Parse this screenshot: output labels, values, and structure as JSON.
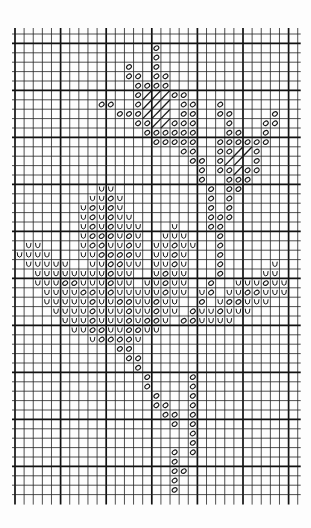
{
  "chart_title": "Cross-stitch pattern chart: flowers and leaves",
  "grid": {
    "cols": 31,
    "rows": 49,
    "origin_x": 15,
    "origin_y": 34,
    "cell_w": 9.12,
    "cell_h": 9.4,
    "heavy_col_every": 5,
    "heavy_col_offset": 0,
    "heavy_row_every": 5,
    "heavy_row_offset": 1,
    "line_color": "#222222",
    "heavy_line_color": "#111111",
    "symbol_color": "#1a1a1a"
  },
  "legend": {
    "o": "oval stitch symbol",
    "u": "u-shaped stitch symbol",
    "h": "hatched (diagonal) fill"
  },
  "cells": [
    {
      "r": 1,
      "c": [
        15
      ],
      "s": "o"
    },
    {
      "r": 2,
      "c": [
        15
      ],
      "s": "o"
    },
    {
      "r": 3,
      "c": [
        12,
        15
      ],
      "s": "o"
    },
    {
      "r": 4,
      "c": [
        12,
        13,
        15,
        16
      ],
      "s": "o"
    },
    {
      "r": 5,
      "c": [
        13,
        14,
        15,
        16
      ],
      "s": "o"
    },
    {
      "r": 6,
      "c": [
        13,
        17,
        18
      ],
      "s": "o"
    },
    {
      "r": 6,
      "c": [
        14,
        15,
        16
      ],
      "s": "h"
    },
    {
      "r": 7,
      "c": [
        9,
        10,
        13,
        18,
        19,
        22
      ],
      "s": "o"
    },
    {
      "r": 7,
      "c": [
        14,
        15,
        16
      ],
      "s": "h"
    },
    {
      "r": 8,
      "c": [
        11,
        12,
        13,
        18,
        19,
        22,
        23,
        28
      ],
      "s": "o"
    },
    {
      "r": 8,
      "c": [
        14,
        15,
        16
      ],
      "s": "h"
    },
    {
      "r": 9,
      "c": [
        13,
        14,
        17,
        18,
        19,
        23,
        27,
        28
      ],
      "s": "o"
    },
    {
      "r": 9,
      "c": [
        15,
        16
      ],
      "s": "h"
    },
    {
      "r": 10,
      "c": [
        14,
        15,
        16,
        17,
        18,
        19,
        23,
        24,
        27
      ],
      "s": "o"
    },
    {
      "r": 11,
      "c": [
        15,
        16,
        17,
        18,
        19,
        22,
        23,
        24,
        25,
        26,
        27
      ],
      "s": "o"
    },
    {
      "r": 12,
      "c": [
        18,
        19,
        22,
        23,
        26
      ],
      "s": "o"
    },
    {
      "r": 12,
      "c": [
        24,
        25
      ],
      "s": "h"
    },
    {
      "r": 13,
      "c": [
        19,
        20,
        22,
        26
      ],
      "s": "o"
    },
    {
      "r": 13,
      "c": [
        23,
        24
      ],
      "s": "h"
    },
    {
      "r": 14,
      "c": [
        20,
        22,
        23,
        25,
        26
      ],
      "s": "o"
    },
    {
      "r": 14,
      "c": [
        24
      ],
      "s": "h"
    },
    {
      "r": 15,
      "c": [
        20,
        23,
        24,
        25
      ],
      "s": "o"
    },
    {
      "r": 16,
      "c": [
        21,
        23,
        24
      ],
      "s": "o"
    },
    {
      "r": 16,
      "c": [
        9,
        10
      ],
      "s": "u"
    },
    {
      "r": 17,
      "c": [
        10,
        21,
        23
      ],
      "s": "o"
    },
    {
      "r": 17,
      "c": [
        8,
        9,
        11
      ],
      "s": "u"
    },
    {
      "r": 18,
      "c": [
        8,
        10,
        21,
        23
      ],
      "s": "o"
    },
    {
      "r": 18,
      "c": [
        7,
        9,
        11
      ],
      "s": "u"
    },
    {
      "r": 19,
      "c": [
        8,
        10,
        21,
        22,
        23
      ],
      "s": "o"
    },
    {
      "r": 19,
      "c": [
        7,
        9,
        11,
        12
      ],
      "s": "u"
    },
    {
      "r": 20,
      "c": [
        8,
        10,
        21,
        22
      ],
      "s": "o"
    },
    {
      "r": 20,
      "c": [
        7,
        9,
        11,
        12,
        13,
        17
      ],
      "s": "u"
    },
    {
      "r": 21,
      "c": [
        8,
        9,
        10,
        12,
        22
      ],
      "s": "o"
    },
    {
      "r": 21,
      "c": [
        7,
        11,
        13,
        16,
        17,
        18
      ],
      "s": "u"
    },
    {
      "r": 22,
      "c": [
        8,
        9,
        12,
        17,
        22
      ],
      "s": "o"
    },
    {
      "r": 22,
      "c": [
        1,
        2,
        7,
        10,
        11,
        13,
        15,
        16,
        18,
        19
      ],
      "s": "u"
    },
    {
      "r": 23,
      "c": [
        9,
        10,
        11,
        12,
        17,
        22
      ],
      "s": "o"
    },
    {
      "r": 23,
      "c": [
        0,
        1,
        2,
        3,
        7,
        8,
        13,
        15,
        16,
        18
      ],
      "s": "u"
    },
    {
      "r": 24,
      "c": [
        10,
        11,
        17,
        22
      ],
      "s": "o"
    },
    {
      "r": 24,
      "c": [
        1,
        2,
        3,
        4,
        5,
        8,
        9,
        12,
        13,
        15,
        16,
        18,
        28
      ],
      "s": "u"
    },
    {
      "r": 25,
      "c": [
        10,
        16,
        22
      ],
      "s": "o"
    },
    {
      "r": 25,
      "c": [
        2,
        3,
        4,
        5,
        6,
        7,
        8,
        9,
        11,
        12,
        15,
        17,
        18,
        27,
        28
      ],
      "s": "u"
    },
    {
      "r": 26,
      "c": [
        5,
        6,
        10,
        16,
        21,
        27
      ],
      "s": "o"
    },
    {
      "r": 26,
      "c": [
        2,
        3,
        4,
        7,
        8,
        9,
        11,
        12,
        14,
        15,
        17,
        18,
        24,
        25,
        26,
        28,
        29
      ],
      "s": "u"
    },
    {
      "r": 27,
      "c": [
        7,
        8,
        10,
        16,
        21,
        25,
        26
      ],
      "s": "o"
    },
    {
      "r": 27,
      "c": [
        3,
        4,
        5,
        6,
        9,
        11,
        12,
        13,
        14,
        15,
        17,
        18,
        20,
        23,
        24,
        27,
        28,
        29
      ],
      "s": "u"
    },
    {
      "r": 28,
      "c": [
        8,
        11,
        12,
        15,
        20,
        23,
        24
      ],
      "s": "o"
    },
    {
      "r": 28,
      "c": [
        3,
        4,
        5,
        6,
        7,
        9,
        10,
        13,
        14,
        16,
        17,
        22,
        25,
        26,
        27
      ],
      "s": "u"
    },
    {
      "r": 29,
      "c": [
        8,
        12,
        15,
        19,
        22
      ],
      "s": "o"
    },
    {
      "r": 29,
      "c": [
        4,
        5,
        6,
        7,
        9,
        10,
        11,
        13,
        14,
        16,
        17,
        20,
        21,
        23,
        24,
        25
      ],
      "s": "u"
    },
    {
      "r": 30,
      "c": [
        8,
        12,
        14,
        15,
        18,
        19
      ],
      "s": "o"
    },
    {
      "r": 30,
      "c": [
        5,
        6,
        7,
        9,
        10,
        11,
        13,
        16,
        20,
        21,
        22,
        23
      ],
      "s": "u"
    },
    {
      "r": 31,
      "c": [
        8,
        9,
        12,
        13
      ],
      "s": "o"
    },
    {
      "r": 31,
      "c": [
        6,
        7,
        10,
        11,
        14,
        15
      ],
      "s": "u"
    },
    {
      "r": 32,
      "c": [
        9,
        10,
        11,
        12
      ],
      "s": "o"
    },
    {
      "r": 32,
      "c": [
        8,
        13
      ],
      "s": "u"
    },
    {
      "r": 33,
      "c": [
        11,
        12
      ],
      "s": "o"
    },
    {
      "r": 34,
      "c": [
        12,
        13
      ],
      "s": "o"
    },
    {
      "r": 35,
      "c": [
        13
      ],
      "s": "o"
    },
    {
      "r": 36,
      "c": [
        14,
        19
      ],
      "s": "o"
    },
    {
      "r": 37,
      "c": [
        14,
        19
      ],
      "s": "o"
    },
    {
      "r": 38,
      "c": [
        15,
        19
      ],
      "s": "o"
    },
    {
      "r": 39,
      "c": [
        15,
        16,
        19
      ],
      "s": "o"
    },
    {
      "r": 40,
      "c": [
        16,
        17,
        19
      ],
      "s": "o"
    },
    {
      "r": 41,
      "c": [
        17,
        19
      ],
      "s": "o"
    },
    {
      "r": 42,
      "c": [
        19
      ],
      "s": "o"
    },
    {
      "r": 43,
      "c": [
        19
      ],
      "s": "o"
    },
    {
      "r": 44,
      "c": [
        17,
        19
      ],
      "s": "o"
    },
    {
      "r": 45,
      "c": [
        17
      ],
      "s": "o"
    },
    {
      "r": 46,
      "c": [
        17,
        18
      ],
      "s": "o"
    },
    {
      "r": 47,
      "c": [
        17
      ],
      "s": "o"
    },
    {
      "r": 48,
      "c": [
        17
      ],
      "s": "o"
    }
  ]
}
